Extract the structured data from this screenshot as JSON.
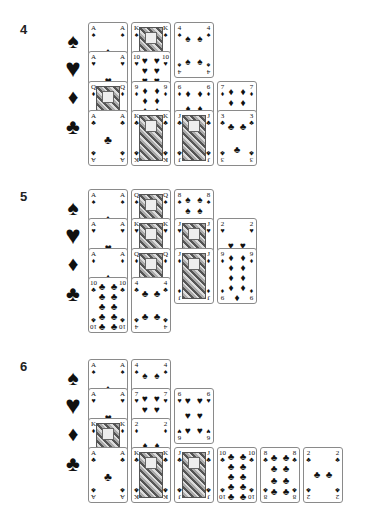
{
  "suits": {
    "spades": "♠",
    "hearts": "♥",
    "diamonds": "♦",
    "clubs": "♣"
  },
  "sections": [
    {
      "label": "4",
      "top": 22,
      "rows": [
        {
          "suit": "spades",
          "cards": [
            {
              "rank": "A",
              "col": 0
            },
            {
              "rank": "K",
              "col": 1,
              "face": true
            },
            {
              "rank": "4",
              "col": 2,
              "full": true
            }
          ]
        },
        {
          "suit": "hearts",
          "cards": [
            {
              "rank": "A",
              "col": 0
            },
            {
              "rank": "10",
              "col": 1
            }
          ]
        },
        {
          "suit": "diamonds",
          "cards": [
            {
              "rank": "Q",
              "col": 0,
              "face": true
            },
            {
              "rank": "9",
              "col": 1
            },
            {
              "rank": "6",
              "col": 2
            },
            {
              "rank": "7",
              "col": 3
            }
          ]
        },
        {
          "suit": "clubs",
          "cards": [
            {
              "rank": "A",
              "col": 0
            },
            {
              "rank": "K",
              "col": 1,
              "face": true
            },
            {
              "rank": "J",
              "col": 2,
              "face": true
            },
            {
              "rank": "3",
              "col": 3
            }
          ]
        }
      ]
    },
    {
      "label": "5",
      "top": 189,
      "rows": [
        {
          "suit": "spades",
          "cards": [
            {
              "rank": "A",
              "col": 0
            },
            {
              "rank": "Q",
              "col": 1,
              "face": true
            },
            {
              "rank": "8",
              "col": 2
            }
          ]
        },
        {
          "suit": "hearts",
          "cards": [
            {
              "rank": "A",
              "col": 0
            },
            {
              "rank": "K",
              "col": 1,
              "face": true
            },
            {
              "rank": "J",
              "col": 2,
              "face": true
            },
            {
              "rank": "2",
              "col": 3
            }
          ]
        },
        {
          "suit": "diamonds",
          "cards": [
            {
              "rank": "A",
              "col": 0
            },
            {
              "rank": "Q",
              "col": 1,
              "face": true
            },
            {
              "rank": "J",
              "col": 2,
              "face": true,
              "full": true
            },
            {
              "rank": "9",
              "col": 3,
              "full": true
            }
          ]
        },
        {
          "suit": "clubs",
          "cards": [
            {
              "rank": "10",
              "col": 0
            },
            {
              "rank": "4",
              "col": 1
            }
          ]
        }
      ]
    },
    {
      "label": "6",
      "top": 359,
      "rows": [
        {
          "suit": "spades",
          "cards": [
            {
              "rank": "A",
              "col": 0
            },
            {
              "rank": "4",
              "col": 1
            }
          ]
        },
        {
          "suit": "hearts",
          "cards": [
            {
              "rank": "A",
              "col": 0
            },
            {
              "rank": "7",
              "col": 1
            },
            {
              "rank": "6",
              "col": 2,
              "full": true
            }
          ]
        },
        {
          "suit": "diamonds",
          "cards": [
            {
              "rank": "K",
              "col": 0,
              "face": true
            },
            {
              "rank": "2",
              "col": 1
            }
          ]
        },
        {
          "suit": "clubs",
          "cards": [
            {
              "rank": "A",
              "col": 0
            },
            {
              "rank": "K",
              "col": 1,
              "face": true
            },
            {
              "rank": "J",
              "col": 2,
              "face": true
            },
            {
              "rank": "10",
              "col": 3
            },
            {
              "rank": "8",
              "col": 4
            },
            {
              "rank": "2",
              "col": 5
            }
          ]
        }
      ]
    }
  ]
}
